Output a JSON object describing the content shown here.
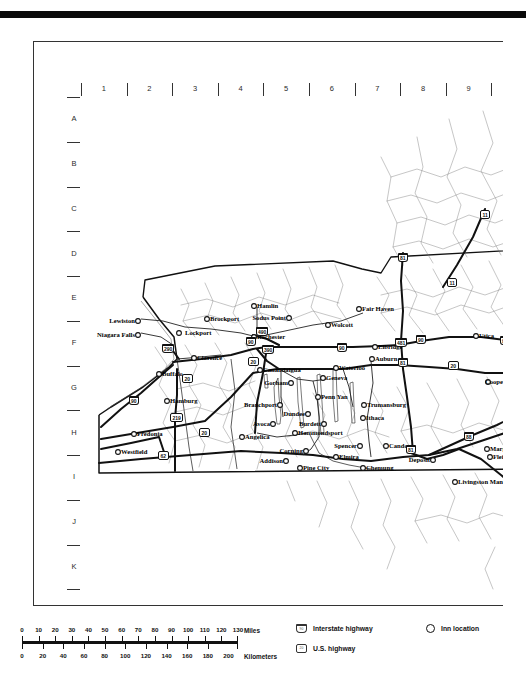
{
  "document": {
    "type": "regional road map",
    "region": "Western and Central New York State",
    "grid": {
      "columns": [
        "1",
        "2",
        "3",
        "4",
        "5",
        "6",
        "7",
        "8",
        "9",
        "10"
      ],
      "rows": [
        "A",
        "B",
        "C",
        "D",
        "E",
        "F",
        "G",
        "H",
        "I",
        "J",
        "K",
        "L"
      ]
    }
  },
  "legend": {
    "scale_miles": {
      "unit_label": "Miles",
      "ticks": [
        "0",
        "10",
        "20",
        "30",
        "40",
        "50",
        "60",
        "70",
        "80",
        "90",
        "100",
        "110",
        "120",
        "130"
      ]
    },
    "scale_kilometers": {
      "unit_label": "Kilometers",
      "ticks": [
        "0",
        "20",
        "40",
        "60",
        "80",
        "100",
        "120",
        "140",
        "160",
        "180",
        "200"
      ]
    },
    "keys": [
      {
        "icon": "interstate-shield-icon",
        "label": "Interstate highway"
      },
      {
        "icon": "us-highway-shield-icon",
        "label": "U.S. highway"
      },
      {
        "icon": "inn-location-icon",
        "label": "Inn location"
      }
    ]
  },
  "map": {
    "cities": [
      {
        "name": "Lewiston",
        "x": 54,
        "y": 224,
        "anchor": "right"
      },
      {
        "name": "Niagara Falls",
        "x": 54,
        "y": 238,
        "anchor": "right"
      },
      {
        "name": "Lockport",
        "x": 104,
        "y": 236,
        "anchor": "left"
      },
      {
        "name": "Clarence",
        "x": 116,
        "y": 261,
        "anchor": "left"
      },
      {
        "name": "Buffalo",
        "x": 81,
        "y": 277,
        "anchor": "left"
      },
      {
        "name": "Hamburg",
        "x": 89,
        "y": 304,
        "anchor": "left"
      },
      {
        "name": "Fredonia",
        "x": 56,
        "y": 337,
        "anchor": "left"
      },
      {
        "name": "Westfield",
        "x": 40,
        "y": 355,
        "anchor": "left"
      },
      {
        "name": "Brockport",
        "x": 129,
        "y": 222,
        "anchor": "left"
      },
      {
        "name": "Hamlin",
        "x": 176,
        "y": 209,
        "anchor": "left"
      },
      {
        "name": "Sodus Point",
        "x": 205,
        "y": 221,
        "anchor": "right"
      },
      {
        "name": "Fair Haven",
        "x": 281,
        "y": 212,
        "anchor": "left"
      },
      {
        "name": "Wolcott",
        "x": 250,
        "y": 228,
        "anchor": "left"
      },
      {
        "name": "Rochester",
        "x": 176,
        "y": 240,
        "anchor": "left"
      },
      {
        "name": "Elbridge",
        "x": 297,
        "y": 250,
        "anchor": "left"
      },
      {
        "name": "Utica",
        "x": 398,
        "y": 239,
        "anchor": "left"
      },
      {
        "name": "Auburn",
        "x": 294,
        "y": 262,
        "anchor": "left"
      },
      {
        "name": "Waterloo",
        "x": 258,
        "y": 271,
        "anchor": "left"
      },
      {
        "name": "Geneva",
        "x": 245,
        "y": 281,
        "anchor": "left"
      },
      {
        "name": "Canandaigua",
        "x": 182,
        "y": 273,
        "anchor": "left"
      },
      {
        "name": "Gorham",
        "x": 207,
        "y": 286,
        "anchor": "right"
      },
      {
        "name": "Cooperstown",
        "x": 404,
        "y": 285,
        "anchor": "left"
      },
      {
        "name": "Penn Yan",
        "x": 240,
        "y": 300,
        "anchor": "left"
      },
      {
        "name": "Branchport",
        "x": 196,
        "y": 308,
        "anchor": "right"
      },
      {
        "name": "Dundee",
        "x": 224,
        "y": 317,
        "anchor": "right"
      },
      {
        "name": "Trumansburg",
        "x": 286,
        "y": 308,
        "anchor": "left"
      },
      {
        "name": "Ithaca",
        "x": 285,
        "y": 321,
        "anchor": "left"
      },
      {
        "name": "Avoca",
        "x": 189,
        "y": 327,
        "anchor": "right"
      },
      {
        "name": "Burdett",
        "x": 240,
        "y": 327,
        "anchor": "right"
      },
      {
        "name": "Hammondsport",
        "x": 217,
        "y": 336,
        "anchor": "left"
      },
      {
        "name": "Angelica",
        "x": 164,
        "y": 340,
        "anchor": "left"
      },
      {
        "name": "Spencer",
        "x": 276,
        "y": 349,
        "anchor": "right"
      },
      {
        "name": "Candor",
        "x": 308,
        "y": 349,
        "anchor": "left"
      },
      {
        "name": "Corning",
        "x": 222,
        "y": 354,
        "anchor": "right"
      },
      {
        "name": "Addison",
        "x": 202,
        "y": 364,
        "anchor": "right"
      },
      {
        "name": "Elmira",
        "x": 258,
        "y": 360,
        "anchor": "left"
      },
      {
        "name": "Pine City",
        "x": 222,
        "y": 371,
        "anchor": "left"
      },
      {
        "name": "Chemung",
        "x": 285,
        "y": 371,
        "anchor": "left"
      },
      {
        "name": "Deposit",
        "x": 349,
        "y": 363,
        "anchor": "right"
      },
      {
        "name": "Margaretville",
        "x": 409,
        "y": 352,
        "anchor": "left"
      },
      {
        "name": "Fleischman",
        "x": 412,
        "y": 360,
        "anchor": "left"
      },
      {
        "name": "Livingston Manor",
        "x": 377,
        "y": 385,
        "anchor": "left"
      }
    ],
    "shields": [
      {
        "type": "interstate",
        "number": "290",
        "x": 86,
        "y": 251
      },
      {
        "type": "us",
        "number": "20",
        "x": 106,
        "y": 281
      },
      {
        "type": "us",
        "number": "20",
        "x": 172,
        "y": 264
      },
      {
        "type": "interstate",
        "number": "90",
        "x": 261,
        "y": 250
      },
      {
        "type": "interstate",
        "number": "90",
        "x": 170,
        "y": 244
      },
      {
        "type": "interstate",
        "number": "390",
        "x": 186,
        "y": 252
      },
      {
        "type": "interstate",
        "number": "490",
        "x": 180,
        "y": 234
      },
      {
        "type": "interstate",
        "number": "90",
        "x": 53,
        "y": 303
      },
      {
        "type": "us",
        "number": "219",
        "x": 94,
        "y": 320
      },
      {
        "type": "us",
        "number": "62",
        "x": 82,
        "y": 358
      },
      {
        "type": "us",
        "number": "20",
        "x": 123,
        "y": 335
      },
      {
        "type": "interstate",
        "number": "81",
        "x": 322,
        "y": 160
      },
      {
        "type": "us",
        "number": "11",
        "x": 371,
        "y": 185
      },
      {
        "type": "us",
        "number": "11",
        "x": 404,
        "y": 117
      },
      {
        "type": "interstate",
        "number": "481",
        "x": 319,
        "y": 245
      },
      {
        "type": "interstate",
        "number": "81",
        "x": 322,
        "y": 265
      },
      {
        "type": "interstate",
        "number": "90",
        "x": 340,
        "y": 242
      },
      {
        "type": "interstate",
        "number": "90",
        "x": 424,
        "y": 243
      },
      {
        "type": "us",
        "number": "20",
        "x": 372,
        "y": 268
      },
      {
        "type": "us",
        "number": "20",
        "x": 442,
        "y": 273
      },
      {
        "type": "interstate",
        "number": "88",
        "x": 388,
        "y": 339
      },
      {
        "type": "interstate",
        "number": "81",
        "x": 330,
        "y": 352
      }
    ]
  }
}
